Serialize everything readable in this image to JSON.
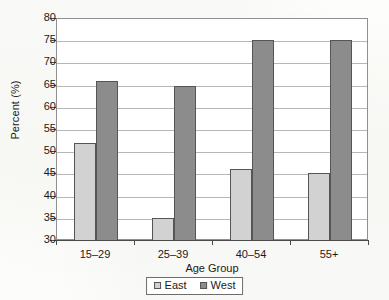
{
  "chart_data": {
    "type": "bar",
    "title": "",
    "subtitle": "",
    "xlabel": "Age Group",
    "ylabel": "Percent (%)",
    "categories": [
      "15–29",
      "25–39",
      "40–54",
      "55+"
    ],
    "series": [
      {
        "name": "East",
        "values": [
          52.0,
          35.2,
          46.2,
          45.3
        ],
        "color": "#d2d2d2"
      },
      {
        "name": "West",
        "values": [
          66.0,
          65.0,
          75.3,
          75.3
        ],
        "color": "#8c8c8c"
      }
    ],
    "ylim": [
      30,
      80
    ],
    "yticks": [
      30,
      35,
      40,
      45,
      50,
      55,
      60,
      65,
      70,
      75,
      80
    ],
    "ytick_labels": [
      "30",
      "35",
      "40",
      "45",
      "50",
      "55",
      "60",
      "65",
      "70",
      "75",
      "80"
    ],
    "grid": true,
    "grid_axis": "y",
    "legend_position": "bottom",
    "legend_entries": [
      "East",
      "West"
    ],
    "bar_outline_color": "#555555",
    "plot_background": "#ffffff",
    "figure_background": "#fdfdfb"
  }
}
